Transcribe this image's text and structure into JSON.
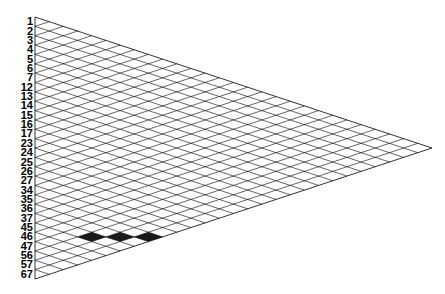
{
  "diagram": {
    "type": "triangular-diamond-lattice",
    "row_labels": [
      "1",
      "2",
      "3",
      "4",
      "5",
      "6",
      "7",
      "12",
      "13",
      "14",
      "15",
      "16",
      "17",
      "23",
      "24",
      "25",
      "26",
      "27",
      "34",
      "35",
      "36",
      "37",
      "45",
      "46",
      "47",
      "56",
      "57",
      "67"
    ],
    "highlighted": {
      "row_label": "46",
      "diamond_indices": [
        2,
        3,
        4
      ],
      "fill_color": "#1a1a1a"
    },
    "line_color": "#000000",
    "background": "#ffffff",
    "geometry": {
      "left_x": 35,
      "top_y": 17,
      "bottom_y": 279,
      "apex_x": 432,
      "apex_y": 148
    }
  }
}
